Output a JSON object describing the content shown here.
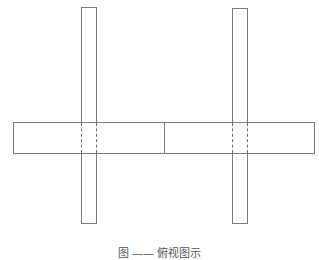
{
  "diagram": {
    "type": "top-view schematic",
    "horizontal_bar": {
      "left": 13,
      "top": 122,
      "width": 302,
      "height": 32,
      "divider_x": 164
    },
    "vertical_bars": [
      {
        "name": "left-post",
        "left": 81,
        "top": 7,
        "width": 16,
        "height": 217
      },
      {
        "name": "right-post",
        "left": 232,
        "top": 8,
        "width": 16,
        "height": 216
      }
    ],
    "line_color": "#7a7a7a"
  },
  "caption": {
    "text": "图 ——  俯视图示"
  }
}
